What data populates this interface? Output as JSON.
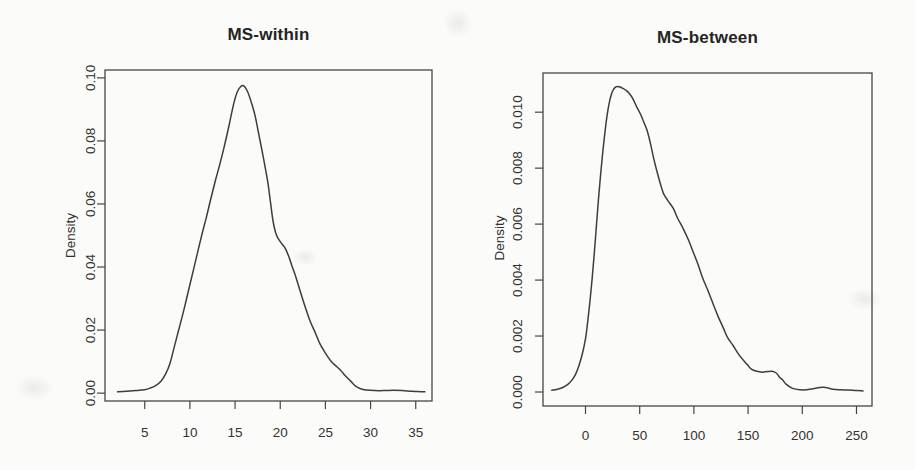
{
  "figure": {
    "background": "#fbfbf9",
    "ink_color": "#454545",
    "curve_color": "#3d3d3d",
    "text_color": "#2e2e2e"
  },
  "chart_data": [
    {
      "type": "line",
      "title": "MS-within",
      "xlabel": "",
      "ylabel": "Density",
      "grid": false,
      "legend": null,
      "x_ticks": [
        "5",
        "10",
        "15",
        "20",
        "25",
        "30",
        "35"
      ],
      "x_tick_values": [
        5,
        10,
        15,
        20,
        25,
        30,
        35
      ],
      "y_ticks": [
        "0.00",
        "0.02",
        "0.04",
        "0.06",
        "0.08",
        "0.10"
      ],
      "y_tick_values": [
        0,
        0.02,
        0.04,
        0.06,
        0.08,
        0.1
      ],
      "xlim": [
        0.6,
        36.8
      ],
      "ylim": [
        -0.0025,
        0.1025
      ],
      "series": [
        {
          "name": "kernel-density",
          "points": [
            [
              2,
              0.0004
            ],
            [
              3,
              0.0006
            ],
            [
              4,
              0.0008
            ],
            [
              5,
              0.0011
            ],
            [
              5.6,
              0.0016
            ],
            [
              6.2,
              0.0024
            ],
            [
              6.8,
              0.0038
            ],
            [
              7.3,
              0.006
            ],
            [
              7.8,
              0.0095
            ],
            [
              8.3,
              0.015
            ],
            [
              8.8,
              0.0205
            ],
            [
              9.3,
              0.026
            ],
            [
              9.8,
              0.032
            ],
            [
              10.3,
              0.038
            ],
            [
              10.8,
              0.044
            ],
            [
              11.3,
              0.05
            ],
            [
              11.8,
              0.0555
            ],
            [
              12.3,
              0.0615
            ],
            [
              12.8,
              0.0672
            ],
            [
              13.3,
              0.0725
            ],
            [
              13.8,
              0.0782
            ],
            [
              14.3,
              0.0845
            ],
            [
              14.8,
              0.0912
            ],
            [
              15.2,
              0.0952
            ],
            [
              15.6,
              0.0972
            ],
            [
              16,
              0.0974
            ],
            [
              16.4,
              0.0955
            ],
            [
              16.8,
              0.0922
            ],
            [
              17.2,
              0.0882
            ],
            [
              17.6,
              0.0825
            ],
            [
              18.1,
              0.0752
            ],
            [
              18.6,
              0.0673
            ],
            [
              18.9,
              0.061
            ],
            [
              19.2,
              0.0546
            ],
            [
              19.5,
              0.0508
            ],
            [
              19.8,
              0.0489
            ],
            [
              20.2,
              0.0473
            ],
            [
              20.6,
              0.0457
            ],
            [
              21,
              0.0429
            ],
            [
              21.3,
              0.0403
            ],
            [
              21.7,
              0.0371
            ],
            [
              22.2,
              0.0324
            ],
            [
              22.8,
              0.027
            ],
            [
              23.3,
              0.0229
            ],
            [
              23.9,
              0.019
            ],
            [
              24.4,
              0.0156
            ],
            [
              25,
              0.0127
            ],
            [
              25.6,
              0.0102
            ],
            [
              26.1,
              0.0088
            ],
            [
              26.7,
              0.0072
            ],
            [
              27.2,
              0.0055
            ],
            [
              27.8,
              0.0038
            ],
            [
              28.3,
              0.0023
            ],
            [
              28.9,
              0.0014
            ],
            [
              29.5,
              0.001
            ],
            [
              30.5,
              0.0008
            ],
            [
              31.5,
              0.0008
            ],
            [
              32.5,
              0.0009
            ],
            [
              33.5,
              0.0008
            ],
            [
              34.5,
              0.0006
            ],
            [
              35.3,
              0.0005
            ],
            [
              36,
              0.0004
            ]
          ]
        }
      ]
    },
    {
      "type": "line",
      "title": "MS-between",
      "xlabel": "",
      "ylabel": "Density",
      "grid": false,
      "legend": null,
      "x_ticks": [
        "0",
        "50",
        "100",
        "150",
        "200",
        "250"
      ],
      "x_tick_values": [
        0,
        50,
        100,
        150,
        200,
        250
      ],
      "y_ticks": [
        "0.000",
        "0.002",
        "0.004",
        "0.006",
        "0.008",
        "0.010"
      ],
      "y_tick_values": [
        0,
        0.002,
        0.004,
        0.006,
        0.008,
        0.01
      ],
      "xlim": [
        -39.2,
        264.3
      ],
      "ylim": [
        -0.0005,
        0.0114
      ],
      "series": [
        {
          "name": "kernel-density",
          "points": [
            [
              -31,
              6e-05
            ],
            [
              -26,
              0.0001
            ],
            [
              -21,
              0.00016
            ],
            [
              -16,
              0.00028
            ],
            [
              -12,
              0.00045
            ],
            [
              -9,
              0.00065
            ],
            [
              -6,
              0.00095
            ],
            [
              -3,
              0.00135
            ],
            [
              0,
              0.0019
            ],
            [
              2,
              0.0025
            ],
            [
              4,
              0.0032
            ],
            [
              6,
              0.004
            ],
            [
              8,
              0.0049
            ],
            [
              10,
              0.0059
            ],
            [
              12,
              0.0069
            ],
            [
              14,
              0.0078
            ],
            [
              16,
              0.0086
            ],
            [
              18,
              0.0093
            ],
            [
              20,
              0.0099
            ],
            [
              22,
              0.01035
            ],
            [
              24,
              0.01065
            ],
            [
              26,
              0.01082
            ],
            [
              28,
              0.0109
            ],
            [
              30,
              0.01092
            ],
            [
              32,
              0.0109
            ],
            [
              34,
              0.01086
            ],
            [
              38,
              0.01076
            ],
            [
              41,
              0.01064
            ],
            [
              44,
              0.01046
            ],
            [
              47,
              0.01021
            ],
            [
              50,
              0.00999
            ],
            [
              52,
              0.00982
            ],
            [
              55,
              0.00953
            ],
            [
              57,
              0.00933
            ],
            [
              60,
              0.00887
            ],
            [
              63,
              0.00833
            ],
            [
              66,
              0.00787
            ],
            [
              69,
              0.00745
            ],
            [
              72,
              0.00709
            ],
            [
              76,
              0.00684
            ],
            [
              81,
              0.00656
            ],
            [
              85,
              0.00621
            ],
            [
              90,
              0.00585
            ],
            [
              95,
              0.00543
            ],
            [
              99,
              0.00504
            ],
            [
              104,
              0.00454
            ],
            [
              108,
              0.00408
            ],
            [
              113,
              0.00362
            ],
            [
              118,
              0.00312
            ],
            [
              122,
              0.00273
            ],
            [
              127,
              0.0023
            ],
            [
              131,
              0.00195
            ],
            [
              136,
              0.00167
            ],
            [
              142,
              0.00131
            ],
            [
              149,
              0.00099
            ],
            [
              153,
              0.00082
            ],
            [
              158,
              0.00074
            ],
            [
              163,
              0.00071
            ],
            [
              168,
              0.00073
            ],
            [
              172,
              0.00074
            ],
            [
              176,
              0.00068
            ],
            [
              179,
              0.00053
            ],
            [
              182,
              0.00043
            ],
            [
              185,
              0.00028
            ],
            [
              191,
              0.00013
            ],
            [
              198,
              8e-05
            ],
            [
              204,
              8e-05
            ],
            [
              210,
              0.00012
            ],
            [
              216,
              0.00016
            ],
            [
              220,
              0.00017
            ],
            [
              224,
              0.00014
            ],
            [
              228,
              0.0001
            ],
            [
              235,
              8e-05
            ],
            [
              242,
              7e-05
            ],
            [
              250,
              5e-05
            ],
            [
              256,
              4e-05
            ]
          ]
        }
      ]
    }
  ]
}
